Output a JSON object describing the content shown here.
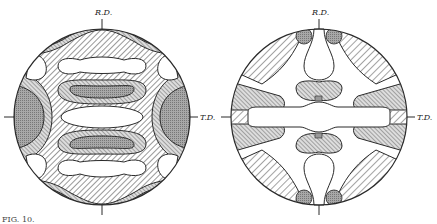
{
  "figure": {
    "panels": [
      {
        "id": "left",
        "labels": {
          "top": "R.D.",
          "right": "T.D."
        },
        "type": "pole-figure"
      },
      {
        "id": "right",
        "labels": {
          "top": "R.D.",
          "right": "T.D."
        },
        "type": "pole-figure"
      }
    ],
    "caption": "FIG. 10."
  },
  "colors": {
    "ink": "#2a2a2a",
    "dark_fill": "#9a9a9a",
    "paper": "#ffffff"
  }
}
